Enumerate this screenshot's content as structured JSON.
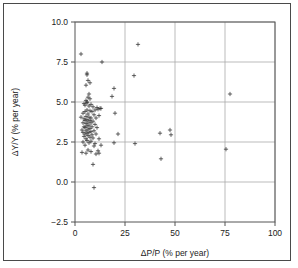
{
  "chart_data": {
    "type": "scatter",
    "title": "",
    "xlabel": "ΔP/P (% per year)",
    "ylabel": "ΔY/Y (% per year)",
    "xlim": [
      0,
      100
    ],
    "ylim": [
      -2.5,
      10.0
    ],
    "xticks": [
      0,
      25,
      50,
      75,
      100
    ],
    "yticks": [
      -2.5,
      0.0,
      2.5,
      5.0,
      7.5,
      10.0
    ],
    "xtick_labels": [
      "0",
      "25",
      "50",
      "75",
      "100"
    ],
    "ytick_labels": [
      "-2.5",
      "0.0",
      "2.5",
      "5.0",
      "7.5",
      "10.0"
    ],
    "grid": true,
    "legend": null,
    "marker": "plus",
    "marker_color": "#333333",
    "points": [
      {
        "x": 3.0,
        "y": 8.0
      },
      {
        "x": 31.5,
        "y": 8.6
      },
      {
        "x": 13.5,
        "y": 7.5
      },
      {
        "x": 6.0,
        "y": 6.8
      },
      {
        "x": 6.0,
        "y": 6.7
      },
      {
        "x": 29.5,
        "y": 6.65
      },
      {
        "x": 6.5,
        "y": 6.35
      },
      {
        "x": 7.5,
        "y": 6.2
      },
      {
        "x": 5.5,
        "y": 6.05
      },
      {
        "x": 19.5,
        "y": 5.85
      },
      {
        "x": 77.5,
        "y": 5.5
      },
      {
        "x": 18.5,
        "y": 5.35
      },
      {
        "x": 7.0,
        "y": 5.5
      },
      {
        "x": 6.5,
        "y": 5.3
      },
      {
        "x": 7.5,
        "y": 5.2
      },
      {
        "x": 5.5,
        "y": 5.1
      },
      {
        "x": 6.0,
        "y": 5.0
      },
      {
        "x": 6.0,
        "y": 4.95
      },
      {
        "x": 4.5,
        "y": 4.9
      },
      {
        "x": 8.0,
        "y": 4.85
      },
      {
        "x": 5.0,
        "y": 4.8
      },
      {
        "x": 7.0,
        "y": 4.75
      },
      {
        "x": 9.0,
        "y": 4.7
      },
      {
        "x": 11.0,
        "y": 4.65
      },
      {
        "x": 12.5,
        "y": 4.6
      },
      {
        "x": 13.0,
        "y": 4.6
      },
      {
        "x": 11.5,
        "y": 4.55
      },
      {
        "x": 10.0,
        "y": 4.5
      },
      {
        "x": 6.0,
        "y": 4.5
      },
      {
        "x": 7.5,
        "y": 4.45
      },
      {
        "x": 5.0,
        "y": 4.4
      },
      {
        "x": 8.5,
        "y": 4.4
      },
      {
        "x": 4.0,
        "y": 4.3
      },
      {
        "x": 20.0,
        "y": 4.3
      },
      {
        "x": 6.5,
        "y": 4.25
      },
      {
        "x": 9.5,
        "y": 4.2
      },
      {
        "x": 12.0,
        "y": 4.15
      },
      {
        "x": 5.5,
        "y": 4.1
      },
      {
        "x": 3.0,
        "y": 4.05
      },
      {
        "x": 7.0,
        "y": 4.05
      },
      {
        "x": 8.0,
        "y": 4.0
      },
      {
        "x": 10.5,
        "y": 4.0
      },
      {
        "x": 4.5,
        "y": 3.95
      },
      {
        "x": 6.0,
        "y": 3.9
      },
      {
        "x": 5.0,
        "y": 3.85
      },
      {
        "x": 7.5,
        "y": 3.85
      },
      {
        "x": 9.0,
        "y": 3.8
      },
      {
        "x": 6.5,
        "y": 3.75
      },
      {
        "x": 4.0,
        "y": 3.7
      },
      {
        "x": 8.0,
        "y": 3.7
      },
      {
        "x": 5.5,
        "y": 3.65
      },
      {
        "x": 10.0,
        "y": 3.6
      },
      {
        "x": 7.0,
        "y": 3.55
      },
      {
        "x": 6.0,
        "y": 3.5
      },
      {
        "x": 4.5,
        "y": 3.45
      },
      {
        "x": 8.5,
        "y": 3.45
      },
      {
        "x": 5.0,
        "y": 3.4
      },
      {
        "x": 11.0,
        "y": 3.4
      },
      {
        "x": 7.5,
        "y": 3.35
      },
      {
        "x": 6.5,
        "y": 3.3
      },
      {
        "x": 3.5,
        "y": 3.25
      },
      {
        "x": 9.5,
        "y": 3.2
      },
      {
        "x": 5.5,
        "y": 3.2
      },
      {
        "x": 8.0,
        "y": 3.15
      },
      {
        "x": 4.0,
        "y": 3.1
      },
      {
        "x": 7.0,
        "y": 3.1
      },
      {
        "x": 6.0,
        "y": 3.05
      },
      {
        "x": 10.5,
        "y": 3.0
      },
      {
        "x": 5.0,
        "y": 3.0
      },
      {
        "x": 21.5,
        "y": 3.0
      },
      {
        "x": 42.5,
        "y": 3.05
      },
      {
        "x": 47.5,
        "y": 3.25
      },
      {
        "x": 48.0,
        "y": 2.95
      },
      {
        "x": 8.5,
        "y": 2.95
      },
      {
        "x": 6.5,
        "y": 2.9
      },
      {
        "x": 4.5,
        "y": 2.85
      },
      {
        "x": 7.5,
        "y": 2.8
      },
      {
        "x": 9.0,
        "y": 2.75
      },
      {
        "x": 5.5,
        "y": 2.7
      },
      {
        "x": 12.0,
        "y": 2.7
      },
      {
        "x": 6.0,
        "y": 2.6
      },
      {
        "x": 8.0,
        "y": 2.55
      },
      {
        "x": 4.0,
        "y": 2.5
      },
      {
        "x": 19.5,
        "y": 2.45
      },
      {
        "x": 7.0,
        "y": 2.45
      },
      {
        "x": 10.0,
        "y": 2.4
      },
      {
        "x": 30.0,
        "y": 2.4
      },
      {
        "x": 13.0,
        "y": 2.3
      },
      {
        "x": 5.0,
        "y": 2.3
      },
      {
        "x": 9.5,
        "y": 2.25
      },
      {
        "x": 75.5,
        "y": 2.05
      },
      {
        "x": 6.5,
        "y": 2.0
      },
      {
        "x": 11.5,
        "y": 1.95
      },
      {
        "x": 8.0,
        "y": 1.9
      },
      {
        "x": 3.5,
        "y": 1.85
      },
      {
        "x": 12.0,
        "y": 1.8
      },
      {
        "x": 5.5,
        "y": 1.8
      },
      {
        "x": 10.5,
        "y": 1.75
      },
      {
        "x": 43.0,
        "y": 1.45
      },
      {
        "x": 9.0,
        "y": 1.1
      },
      {
        "x": 9.5,
        "y": -0.35
      }
    ]
  }
}
